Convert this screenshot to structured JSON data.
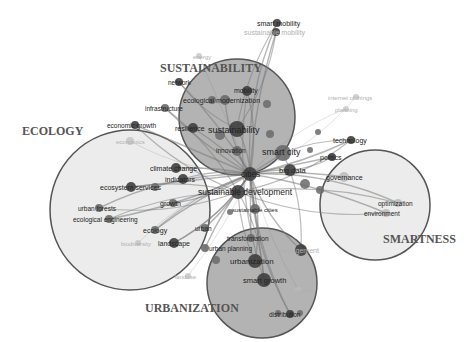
{
  "colors": {
    "cluster_fill_dark": "#9a9a9a",
    "cluster_fill_light": "#e4e4e4",
    "cluster_stroke": "#555555",
    "edge": "#7a7a7a",
    "node_dark": "#3f3f3f",
    "node_mid": "#6a6a6a",
    "node_faint": "#bdbdbd",
    "label_dark": "#222222",
    "label_faint": "#b0b0b0",
    "cluster_title": "#555555"
  },
  "clusters": [
    {
      "id": "sustainability",
      "title": "SUSTAINABILITY",
      "cx": 237,
      "cy": 117,
      "r": 58,
      "fill": "dark",
      "title_x": 160,
      "title_y": 72
    },
    {
      "id": "ecology",
      "title": "ECOLOGY",
      "cx": 130,
      "cy": 210,
      "r": 80,
      "fill": "light",
      "title_x": 22,
      "title_y": 135
    },
    {
      "id": "smartness",
      "title": "SMARTNESS",
      "cx": 375,
      "cy": 205,
      "r": 55,
      "fill": "light",
      "title_x": 383,
      "title_y": 243
    },
    {
      "id": "urbanization",
      "title": "URBANIZATION",
      "cx": 262,
      "cy": 283,
      "r": 55,
      "fill": "dark",
      "title_x": 145,
      "title_y": 312
    }
  ],
  "hub": {
    "x": 250,
    "y": 174
  },
  "nodes": [
    {
      "label": "smart mobility",
      "x": 277,
      "y": 23,
      "lx": 257,
      "ly": 26,
      "size": 4,
      "tone": "dark",
      "faint": false,
      "fs": 7
    },
    {
      "label": "sustainable mobility",
      "x": 276,
      "y": 32,
      "lx": 244,
      "ly": 35,
      "size": 4,
      "tone": "dark",
      "faint": false,
      "fs": 7,
      "label_faint": true
    },
    {
      "label": "energy",
      "x": 199,
      "y": 56,
      "lx": 193,
      "ly": 59,
      "size": 3,
      "tone": "faint",
      "faint": true,
      "fs": 6
    },
    {
      "label": "network",
      "x": 179,
      "y": 82,
      "lx": 168,
      "ly": 85,
      "size": 4,
      "tone": "dark",
      "faint": false,
      "fs": 6.5
    },
    {
      "label": "mobility",
      "x": 247,
      "y": 91,
      "lx": 234,
      "ly": 93,
      "size": 5,
      "tone": "dark",
      "faint": false,
      "fs": 7
    },
    {
      "label": "ecological modernization",
      "x": 225,
      "y": 100,
      "lx": 183,
      "ly": 103,
      "size": 5,
      "tone": "mid",
      "faint": false,
      "fs": 7
    },
    {
      "label": "infrastructure",
      "x": 165,
      "y": 108,
      "lx": 145,
      "ly": 111,
      "size": 4,
      "tone": "mid",
      "faint": false,
      "fs": 6.5
    },
    {
      "label": "economic growth",
      "x": 135,
      "y": 125,
      "lx": 107,
      "ly": 128,
      "size": 4,
      "tone": "dark",
      "faint": false,
      "fs": 6.5
    },
    {
      "label": "resilience",
      "x": 193,
      "y": 128,
      "lx": 175,
      "ly": 131,
      "size": 5,
      "tone": "dark",
      "faint": false,
      "fs": 7
    },
    {
      "label": "sustainability",
      "x": 237,
      "y": 129,
      "lx": 208,
      "ly": 133,
      "size": 8,
      "tone": "dark",
      "faint": false,
      "fs": 9
    },
    {
      "label": "economics",
      "x": 130,
      "y": 141,
      "lx": 116,
      "ly": 144,
      "size": 4,
      "tone": "faint",
      "faint": true,
      "fs": 6
    },
    {
      "label": "innovation",
      "x": 237,
      "y": 151,
      "lx": 216,
      "ly": 153,
      "size": 5,
      "tone": "mid",
      "faint": false,
      "fs": 6.5
    },
    {
      "label": "smart city",
      "x": 283,
      "y": 153,
      "lx": 262,
      "ly": 155,
      "size": 8,
      "tone": "mid",
      "faint": false,
      "fs": 9
    },
    {
      "label": "climate change",
      "x": 176,
      "y": 168,
      "lx": 150,
      "ly": 171,
      "size": 5,
      "tone": "dark",
      "faint": false,
      "fs": 7
    },
    {
      "label": "indicators",
      "x": 183,
      "y": 179,
      "lx": 165,
      "ly": 182,
      "size": 5,
      "tone": "dark",
      "faint": false,
      "fs": 7
    },
    {
      "label": "cities",
      "x": 250,
      "y": 174,
      "lx": 241,
      "ly": 177,
      "size": 7,
      "tone": "dark",
      "faint": false,
      "fs": 8.5
    },
    {
      "label": "big data",
      "x": 290,
      "y": 170,
      "lx": 279,
      "ly": 173,
      "size": 6,
      "tone": "dark",
      "faint": false,
      "fs": 7.5
    },
    {
      "label": "politics",
      "x": 332,
      "y": 157,
      "lx": 320,
      "ly": 160,
      "size": 4,
      "tone": "dark",
      "faint": false,
      "fs": 7
    },
    {
      "label": "technology",
      "x": 351,
      "y": 140,
      "lx": 333,
      "ly": 143,
      "size": 4,
      "tone": "dark",
      "faint": false,
      "fs": 7
    },
    {
      "label": "internet of things",
      "x": 356,
      "y": 97,
      "lx": 328,
      "ly": 100,
      "size": 3,
      "tone": "faint",
      "faint": true,
      "fs": 6
    },
    {
      "label": "planning",
      "x": 346,
      "y": 109,
      "lx": 335,
      "ly": 112,
      "size": 3,
      "tone": "faint",
      "faint": true,
      "fs": 6
    },
    {
      "label": "governance",
      "x": 344,
      "y": 177,
      "lx": 326,
      "ly": 180,
      "size": 5,
      "tone": "faint",
      "faint": false,
      "fs": 7
    },
    {
      "label": "ecosystem services",
      "x": 131,
      "y": 187,
      "lx": 100,
      "ly": 190,
      "size": 5,
      "tone": "dark",
      "faint": false,
      "fs": 7
    },
    {
      "label": "sustainable development",
      "x": 238,
      "y": 192,
      "lx": 198,
      "ly": 195,
      "size": 7,
      "tone": "dark",
      "faint": false,
      "fs": 8.5
    },
    {
      "label": "urban forests",
      "x": 99,
      "y": 208,
      "lx": 78,
      "ly": 211,
      "size": 4,
      "tone": "mid",
      "faint": false,
      "fs": 6.5
    },
    {
      "label": "growth",
      "x": 173,
      "y": 203,
      "lx": 160,
      "ly": 206,
      "size": 4,
      "tone": "mid",
      "faint": false,
      "fs": 7
    },
    {
      "label": "ecological engineering",
      "x": 109,
      "y": 219,
      "lx": 73,
      "ly": 222,
      "size": 4,
      "tone": "mid",
      "faint": false,
      "fs": 6.5
    },
    {
      "label": "sustainable cities",
      "x": 255,
      "y": 209,
      "lx": 232,
      "ly": 212,
      "size": 5,
      "tone": "mid",
      "faint": false,
      "fs": 6
    },
    {
      "label": "ecology",
      "x": 155,
      "y": 230,
      "lx": 143,
      "ly": 233,
      "size": 4,
      "tone": "mid",
      "faint": false,
      "fs": 7
    },
    {
      "label": "biodiversity",
      "x": 138,
      "y": 243,
      "lx": 121,
      "ly": 246,
      "size": 3,
      "tone": "faint",
      "faint": true,
      "fs": 6
    },
    {
      "label": "landscape",
      "x": 174,
      "y": 243,
      "lx": 158,
      "ly": 246,
      "size": 5,
      "tone": "dark",
      "faint": false,
      "fs": 7
    },
    {
      "label": "urban",
      "x": 205,
      "y": 228,
      "lx": 195,
      "ly": 231,
      "size": 4,
      "tone": "mid",
      "faint": false,
      "fs": 6.5
    },
    {
      "label": "transformation",
      "x": 251,
      "y": 238,
      "lx": 227,
      "ly": 241,
      "size": 4,
      "tone": "mid",
      "faint": false,
      "fs": 6.5
    },
    {
      "label": "urban planning",
      "x": 205,
      "y": 248,
      "lx": 209,
      "ly": 251,
      "size": 4,
      "tone": "mid",
      "faint": false,
      "fs": 6.5
    },
    {
      "label": "management",
      "x": 301,
      "y": 250,
      "lx": 278,
      "ly": 253,
      "size": 6,
      "tone": "dark",
      "faint": false,
      "fs": 7,
      "label_faint": true
    },
    {
      "label": "urbanization",
      "x": 255,
      "y": 261,
      "lx": 230,
      "ly": 264,
      "size": 7,
      "tone": "dark",
      "faint": false,
      "fs": 8
    },
    {
      "label": "landuse",
      "x": 188,
      "y": 276,
      "lx": 175,
      "ly": 279,
      "size": 3,
      "tone": "faint",
      "faint": true,
      "fs": 6
    },
    {
      "label": "smart growth",
      "x": 264,
      "y": 280,
      "lx": 243,
      "ly": 283,
      "size": 7,
      "tone": "dark",
      "faint": false,
      "fs": 7.5
    },
    {
      "label": "spatial",
      "x": 298,
      "y": 290,
      "lx": 295,
      "ly": 293,
      "size": 3,
      "tone": "faint",
      "faint": true,
      "fs": 6
    },
    {
      "label": "distribution",
      "x": 290,
      "y": 314,
      "lx": 269,
      "ly": 317,
      "size": 4,
      "tone": "dark",
      "faint": false,
      "fs": 6.5
    },
    {
      "label": "optimization",
      "x": 398,
      "y": 203,
      "lx": 378,
      "ly": 206,
      "size": 4,
      "tone": "faint",
      "faint": false,
      "fs": 6.5
    },
    {
      "label": "environment",
      "x": 386,
      "y": 213,
      "lx": 364,
      "ly": 216,
      "size": 4,
      "tone": "faint",
      "faint": false,
      "fs": 6.5
    }
  ],
  "extra_nodes": [
    {
      "x": 318,
      "y": 132,
      "size": 3
    },
    {
      "x": 310,
      "y": 150,
      "size": 3
    },
    {
      "x": 305,
      "y": 184,
      "size": 5
    },
    {
      "x": 320,
      "y": 190,
      "size": 4
    },
    {
      "x": 212,
      "y": 100,
      "size": 4
    },
    {
      "x": 267,
      "y": 104,
      "size": 4
    },
    {
      "x": 270,
      "y": 134,
      "size": 4
    },
    {
      "x": 220,
      "y": 135,
      "size": 5
    },
    {
      "x": 155,
      "y": 187,
      "size": 4
    },
    {
      "x": 216,
      "y": 260,
      "size": 4
    },
    {
      "x": 278,
      "y": 313,
      "size": 3
    },
    {
      "x": 300,
      "y": 313,
      "size": 3
    },
    {
      "x": 230,
      "y": 212,
      "size": 3
    }
  ]
}
